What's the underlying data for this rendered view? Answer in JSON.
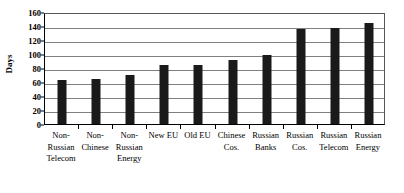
{
  "chart_data": {
    "type": "bar",
    "title": "",
    "subtitle": "",
    "xlabel": "",
    "ylabel": "Days",
    "ylim": [
      0,
      160
    ],
    "ytick_step": 20,
    "yticks": [
      0,
      20,
      40,
      60,
      80,
      100,
      120,
      140,
      160
    ],
    "grid": true,
    "legend": false,
    "legend_position": "none",
    "bar_color": "#1a1a1a",
    "gridline_color": "#808080",
    "axis_color": "#000000",
    "background_color": "#ffffff",
    "categories": [
      "Non-Russian Telecom",
      "Non-Chinese",
      "Non-Russian Energy",
      "New EU",
      "Old EU",
      "Chinese Cos.",
      "Russian Banks",
      "Russian Cos.",
      "Russian Telecom",
      "Russian Energy"
    ],
    "category_label_lines": [
      [
        "Non-",
        "Russian",
        "Telecom"
      ],
      [
        "Non-",
        "Chinese"
      ],
      [
        "Non-",
        "Russian",
        "Energy"
      ],
      [
        "New EU"
      ],
      [
        "Old EU"
      ],
      [
        "Chinese",
        "Cos."
      ],
      [
        "Russian",
        "Banks"
      ],
      [
        "Russian",
        "Cos."
      ],
      [
        "Russian",
        "Telecom"
      ],
      [
        "Russian",
        "Energy"
      ]
    ],
    "values": [
      63,
      65,
      70,
      85,
      85,
      92,
      98,
      136,
      137,
      145
    ]
  }
}
